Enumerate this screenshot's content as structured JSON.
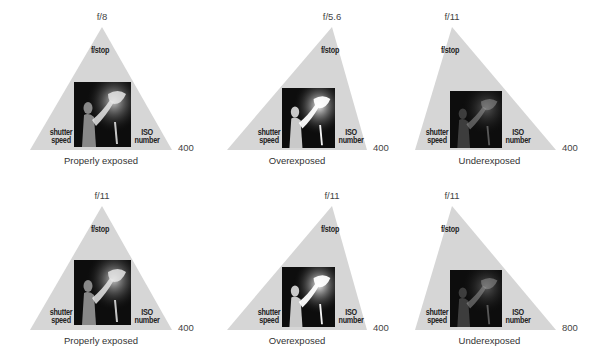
{
  "axis_titles": {
    "top": "f/stop",
    "left_line1": "shutter",
    "left_line2": "speed",
    "right_line1": "ISO",
    "right_line2": "number"
  },
  "colors": {
    "triangle_fill": "#d6d6d6",
    "photo_bg": "#0d0d0d"
  },
  "panels": [
    {
      "fstop": "f/8",
      "shutter": "125",
      "iso": "400",
      "caption": "Properly exposed",
      "apex": [
        102,
        27
      ],
      "base_left": [
        30,
        150
      ],
      "base_right": [
        172,
        150
      ],
      "photo": {
        "x": 74,
        "y": 82,
        "w": 57,
        "h": 65,
        "brightness": "normal"
      }
    },
    {
      "fstop": "f/5.6",
      "shutter": "125",
      "iso": "400",
      "caption": "Overexposed",
      "apex": [
        332,
        27
      ],
      "base_left": [
        227,
        150
      ],
      "base_right": [
        367,
        150
      ],
      "photo": {
        "x": 282,
        "y": 88,
        "w": 53,
        "h": 60,
        "brightness": "over"
      }
    },
    {
      "fstop": "f/11",
      "shutter": "125",
      "iso": "400",
      "caption": "Underexposed",
      "apex": [
        452,
        27
      ],
      "base_left": [
        415,
        150
      ],
      "base_right": [
        556,
        150
      ],
      "photo": {
        "x": 450,
        "y": 91,
        "w": 52,
        "h": 57,
        "brightness": "under"
      }
    },
    {
      "fstop": "f/11",
      "shutter": "60",
      "iso": "400",
      "caption": "Properly exposed",
      "apex": [
        102,
        206
      ],
      "base_left": [
        30,
        330
      ],
      "base_right": [
        172,
        330
      ],
      "photo": {
        "x": 74,
        "y": 260,
        "w": 57,
        "h": 65,
        "brightness": "normal"
      }
    },
    {
      "fstop": "f/11",
      "shutter": "30",
      "iso": "400",
      "caption": "Overexposed",
      "apex": [
        332,
        206
      ],
      "base_left": [
        227,
        330
      ],
      "base_right": [
        367,
        330
      ],
      "photo": {
        "x": 282,
        "y": 267,
        "w": 53,
        "h": 60,
        "brightness": "over"
      }
    },
    {
      "fstop": "f/11",
      "shutter": "60",
      "iso": "800",
      "caption": "Underexposed",
      "apex": [
        452,
        206
      ],
      "base_left": [
        415,
        330
      ],
      "base_right": [
        556,
        330
      ],
      "photo": {
        "x": 450,
        "y": 270,
        "w": 52,
        "h": 57,
        "brightness": "under"
      }
    }
  ]
}
